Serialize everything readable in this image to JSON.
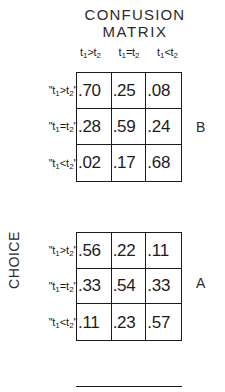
{
  "figure": {
    "title_line_1": "CONFUSION",
    "title_line_2": "MATRIX",
    "axis_label_y": "CHOICE",
    "bottom_rule": "partial-matrix-top-border"
  },
  "relations": {
    "greater": {
      "base": "t",
      "sub1": "1",
      "op": ">",
      "sub2": "2"
    },
    "equal": {
      "base": "t",
      "sub1": "1",
      "op": "=",
      "sub2": "2"
    },
    "less": {
      "base": "t",
      "sub1": "1",
      "op": "<",
      "sub2": "2"
    }
  },
  "column_headers": [
    {
      "text": "t1>t2",
      "base": "t",
      "sub1": "1",
      "op": ">",
      "sub2": "2"
    },
    {
      "text": "t1=t2",
      "base": "t",
      "sub1": "1",
      "op": "=",
      "sub2": "2"
    },
    {
      "text": "t1<t2",
      "base": "t",
      "sub1": "1",
      "op": "<",
      "sub2": "2"
    }
  ],
  "row_headers": [
    {
      "text": "\"t1>t2\"",
      "quote_open": "\"",
      "base": "t",
      "sub1": "1",
      "op": ">",
      "sub2": "2",
      "quote_close": "\""
    },
    {
      "text": "\"t1=t2\"",
      "quote_open": "\"",
      "base": "t",
      "sub1": "1",
      "op": "=",
      "sub2": "2",
      "quote_close": "\""
    },
    {
      "text": "\"t1<t2\"",
      "quote_open": "\"",
      "base": "t",
      "sub1": "1",
      "op": "<",
      "sub2": "2",
      "quote_close": "\""
    }
  ],
  "panels": {
    "upper": {
      "letter": "B"
    },
    "lower": {
      "letter": "A"
    }
  },
  "chart_data": {
    "type": "table",
    "title": "CONFUSION MATRIX",
    "ylabel": "CHOICE",
    "xlabel": "",
    "grid": true,
    "legend": "none",
    "panels": [
      {
        "name": "B",
        "position": "upper",
        "columns": [
          "t1>t2",
          "t1=t2",
          "t1<t2"
        ],
        "rows": [
          "\"t1>t2\"",
          "\"t1=t2\"",
          "\"t1<t2\""
        ],
        "values": [
          [
            ".70",
            ".25",
            ".08"
          ],
          [
            ".28",
            ".59",
            ".24"
          ],
          [
            ".02",
            ".17",
            ".68"
          ]
        ],
        "numeric": [
          [
            0.7,
            0.25,
            0.08
          ],
          [
            0.28,
            0.59,
            0.24
          ],
          [
            0.02,
            0.17,
            0.68
          ]
        ]
      },
      {
        "name": "A",
        "position": "lower",
        "columns": [
          "t1>t2",
          "t1=t2",
          "t1<t2"
        ],
        "rows": [
          "\"t1>t2\"",
          "\"t1=t2\"",
          "\"t1<t2\""
        ],
        "values": [
          [
            ".56",
            ".22",
            ".11"
          ],
          [
            ".33",
            ".54",
            ".33"
          ],
          [
            ".11",
            ".23",
            ".57"
          ]
        ],
        "numeric": [
          [
            0.56,
            0.22,
            0.11
          ],
          [
            0.33,
            0.54,
            0.33
          ],
          [
            0.11,
            0.23,
            0.57
          ]
        ]
      }
    ]
  },
  "colors": {
    "background": "#ffffff",
    "ink": "#1a1a1a",
    "text": "#2b2b2b"
  }
}
